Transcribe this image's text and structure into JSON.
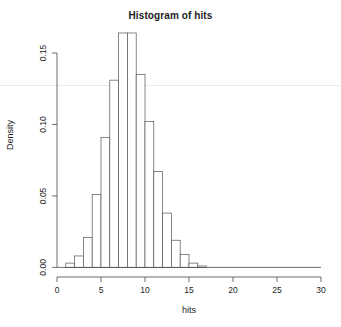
{
  "chart_data": {
    "type": "bar",
    "title": "Histogram of hits",
    "xlabel": "hits",
    "ylabel": "Density",
    "grid": false,
    "legend": null,
    "xlim": [
      0,
      30
    ],
    "ylim": [
      0.0,
      0.165
    ],
    "bin_width": 1,
    "xticks": [
      0,
      5,
      10,
      15,
      20,
      25,
      30
    ],
    "xtick_labels": [
      "0",
      "5",
      "10",
      "15",
      "20",
      "25",
      "30"
    ],
    "yticks": [
      0.0,
      0.05,
      0.1,
      0.15
    ],
    "ytick_labels": [
      "0.00",
      "0.05",
      "0.10",
      "0.15"
    ],
    "bin_starts": [
      1,
      2,
      3,
      4,
      5,
      6,
      7,
      8,
      9,
      10,
      11,
      12,
      13,
      14,
      15,
      16
    ],
    "categories": [
      "1",
      "2",
      "3",
      "4",
      "5",
      "6",
      "7",
      "8",
      "9",
      "10",
      "11",
      "12",
      "13",
      "14",
      "15",
      "16"
    ],
    "values": [
      0.003,
      0.008,
      0.021,
      0.051,
      0.091,
      0.131,
      0.164,
      0.164,
      0.135,
      0.102,
      0.067,
      0.038,
      0.019,
      0.009,
      0.003,
      0.001
    ]
  },
  "axes": {
    "x_axis_name": "hits-axis",
    "y_axis_name": "density-axis"
  }
}
